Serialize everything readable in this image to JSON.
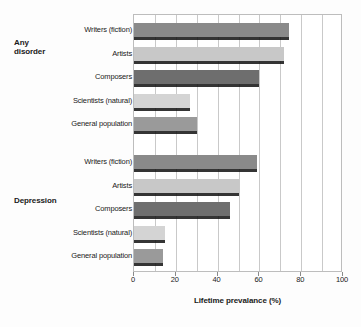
{
  "chart_data": {
    "type": "bar",
    "orientation": "horizontal",
    "title": "",
    "subtitle": "",
    "xlabel": "Lifetime prevalance (%)",
    "ylabel": "",
    "xlim": [
      0,
      100
    ],
    "xticks": [
      0,
      20,
      40,
      60,
      80,
      100
    ],
    "xtick_labels": [
      "0",
      "20",
      "40",
      "60",
      "80",
      "100"
    ],
    "gridline_step": 10,
    "grid": true,
    "legend": "none",
    "groups": [
      {
        "name": "Any disorder",
        "label_lines": "Any\ndisorder",
        "categories": [
          "Writers (fiction)",
          "Artists",
          "Composers",
          "Scientists (natural)",
          "General population"
        ],
        "values": [
          74,
          72,
          60,
          27,
          30
        ]
      },
      {
        "name": "Depression",
        "label_lines": "Depression",
        "categories": [
          "Writers (fiction)",
          "Artists",
          "Composers",
          "Scientists (natural)",
          "General population"
        ],
        "values": [
          59,
          50,
          46,
          15,
          14
        ]
      }
    ],
    "series_colors": {
      "Writers (fiction)": "#8a8a8a",
      "Artists": "#c8c8c8",
      "Composers": "#6e6e6e",
      "Scientists (natural)": "#d4d4d4",
      "General population": "#9a9a9a"
    },
    "bar_shadow_color": "#111111",
    "plot_border_color": "#bdbdbd",
    "gridline_color": "#c9c9c9",
    "text_color": "#1a1a1a",
    "background_color": "#fdfdfd"
  }
}
